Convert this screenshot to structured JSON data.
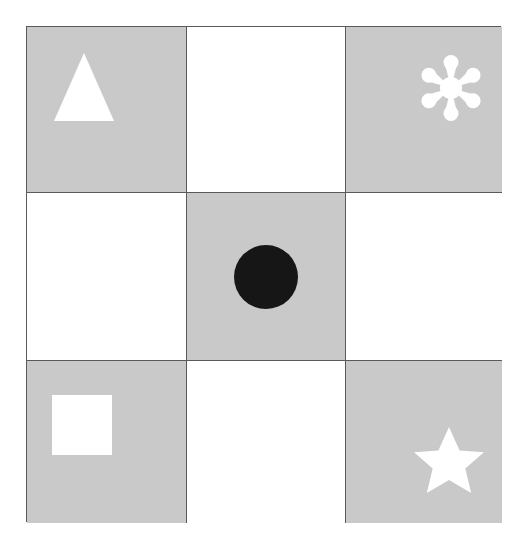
{
  "figure": {
    "type": "matrix-grid",
    "rows": 3,
    "columns": 3,
    "background_color": "#ffffff",
    "gridline_color": "#5a5a5a",
    "shaded_cell_color": "#c9c9c9",
    "plain_cell_color": "#ffffff",
    "shape_fill_white": "#ffffff",
    "shape_fill_black": "#161616"
  },
  "cells": [
    {
      "position": "row-1-col-1",
      "row": 1,
      "column": 1,
      "shading": "gray",
      "shape": "triangle",
      "shape_color": "white",
      "label": "triangle-shape"
    },
    {
      "position": "row-1-col-2",
      "row": 1,
      "column": 2,
      "shading": "white",
      "shape": "none",
      "shape_color": "",
      "label": "empty-cell"
    },
    {
      "position": "row-1-col-3",
      "row": 1,
      "column": 3,
      "shading": "gray",
      "shape": "flower",
      "shape_color": "white",
      "label": "flower-asterisk-shape"
    },
    {
      "position": "row-2-col-1",
      "row": 2,
      "column": 1,
      "shading": "white",
      "shape": "none",
      "shape_color": "",
      "label": "empty-cell"
    },
    {
      "position": "row-2-col-2",
      "row": 2,
      "column": 2,
      "shading": "gray",
      "shape": "circle",
      "shape_color": "black",
      "label": "circle-shape"
    },
    {
      "position": "row-2-col-3",
      "row": 2,
      "column": 3,
      "shading": "white",
      "shape": "none",
      "shape_color": "",
      "label": "empty-cell"
    },
    {
      "position": "row-3-col-1",
      "row": 3,
      "column": 1,
      "shading": "gray",
      "shape": "square",
      "shape_color": "white",
      "label": "square-shape"
    },
    {
      "position": "row-3-col-2",
      "row": 3,
      "column": 2,
      "shading": "white",
      "shape": "none",
      "shape_color": "",
      "label": "empty-cell"
    },
    {
      "position": "row-3-col-3",
      "row": 3,
      "column": 3,
      "shading": "gray",
      "shape": "star",
      "shape_color": "white",
      "label": "five-pointed-star-shape"
    }
  ]
}
